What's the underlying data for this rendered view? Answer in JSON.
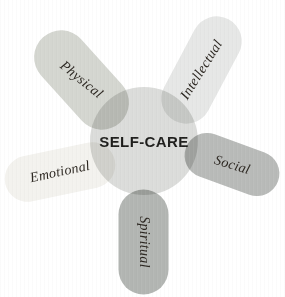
{
  "diagram": {
    "title": "SELF-CARE",
    "title_color": "#1d1d1b",
    "label_color": "#2b2620",
    "center_color": "#dbdcda",
    "background_color": "#ffffff",
    "petals": [
      {
        "id": "physical",
        "label": "Physical",
        "color": "#d4d6d0",
        "position": "upper-left"
      },
      {
        "id": "intellectual",
        "label": "Intellectual",
        "color": "#e6e7e6",
        "position": "upper-right"
      },
      {
        "id": "emotional",
        "label": "Emotional",
        "color": "#f3f2ee",
        "position": "left"
      },
      {
        "id": "social",
        "label": "Social",
        "color": "#b8bab8",
        "position": "right"
      },
      {
        "id": "spiritual",
        "label": "Spiritual",
        "color": "#b2b5b2",
        "position": "bottom"
      }
    ]
  }
}
